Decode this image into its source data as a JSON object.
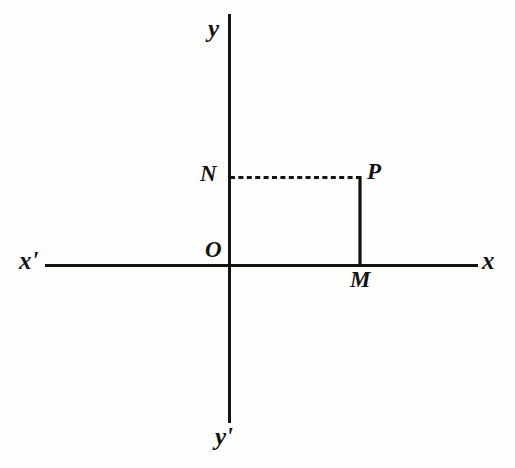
{
  "figure": {
    "kind": "cartesian-coordinate-diagram",
    "background_color": "#fdfdfc",
    "ink_color": "#14110f",
    "axes": {
      "x_axis": {
        "label_positive": "x",
        "label_negative": "x'",
        "y_pixel": 265,
        "x_start_pixel": 45,
        "x_end_pixel": 478,
        "stroke_width": 3,
        "style": "solid"
      },
      "y_axis": {
        "label_positive": "y",
        "label_negative": "y'",
        "x_pixel": 229,
        "y_start_pixel": 14,
        "y_end_pixel": 423,
        "stroke_width": 3,
        "style": "solid"
      }
    },
    "points": [
      {
        "id": "origin",
        "label": "O",
        "x_pixel": 229,
        "y_pixel": 265,
        "description": "origin where the axes intersect"
      },
      {
        "id": "point-p",
        "label": "P",
        "x_pixel": 360,
        "y_pixel": 177,
        "description": "plotted point in the first quadrant"
      },
      {
        "id": "foot-m",
        "label": "M",
        "x_pixel": 360,
        "y_pixel": 265,
        "description": "foot of perpendicular from P to the x-axis"
      },
      {
        "id": "foot-n",
        "label": "N",
        "x_pixel": 229,
        "y_pixel": 177,
        "description": "foot of perpendicular from P to the y-axis"
      }
    ],
    "segments": [
      {
        "id": "segment-np",
        "label": "NP",
        "from": "foot-n",
        "to": "point-p",
        "style": "dashed",
        "dash_pattern": "5 3",
        "stroke_width": 3,
        "orientation": "horizontal"
      },
      {
        "id": "segment-pm",
        "label": "PM",
        "from": "point-p",
        "to": "foot-m",
        "style": "solid",
        "stroke_width": 3,
        "orientation": "vertical"
      }
    ]
  },
  "labels": {
    "y_positive": "y",
    "y_negative": "y'",
    "x_positive": "x",
    "x_negative": "x'",
    "origin": "O",
    "point_p": "P",
    "foot_m": "M",
    "foot_n": "N"
  }
}
